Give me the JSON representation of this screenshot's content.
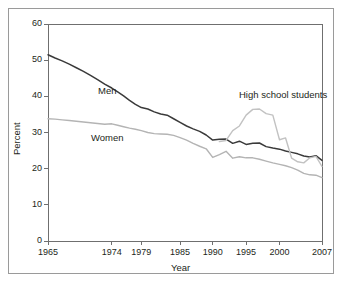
{
  "chart_data": {
    "type": "line",
    "title": "",
    "xlabel": "Year",
    "ylabel": "Percent",
    "xlim": [
      1965,
      2007
    ],
    "ylim": [
      0,
      60
    ],
    "ytick_labels": [
      "60",
      "50",
      "40",
      "30",
      "20",
      "10",
      "0"
    ],
    "yticks": [
      60,
      50,
      40,
      30,
      20,
      10,
      0
    ],
    "xtick_labels": [
      "1965",
      "1974",
      "1979",
      "1985",
      "1990",
      "1995",
      "2000",
      "2007"
    ],
    "xticks": [
      1965,
      1974,
      1979,
      1985,
      1990,
      1995,
      2000,
      2007
    ],
    "grid": false,
    "legend_position": "inline-annotations",
    "annotations": [
      {
        "text": "Men",
        "x": 1972,
        "y": 41.5
      },
      {
        "text": "Women",
        "x": 1971,
        "y": 28.5
      },
      {
        "text": "High school students",
        "x": 1994,
        "y": 40.5
      }
    ],
    "series": [
      {
        "name": "Men",
        "color": "#3a3a3a",
        "x": [
          1965,
          1966,
          1967,
          1968,
          1969,
          1970,
          1971,
          1972,
          1973,
          1974,
          1975,
          1976,
          1977,
          1978,
          1979,
          1980,
          1981,
          1982,
          1983,
          1984,
          1985,
          1986,
          1987,
          1988,
          1989,
          1990,
          1991,
          1992,
          1993,
          1994,
          1995,
          1996,
          1997,
          1998,
          1999,
          2000,
          2001,
          2002,
          2003,
          2004,
          2005,
          2006,
          2007
        ],
        "values": [
          51.5,
          50.6,
          49.8,
          48.9,
          47.9,
          46.9,
          45.8,
          44.6,
          43.4,
          42.3,
          41.2,
          40.1,
          38.9,
          37.8,
          36.9,
          36.5,
          35.7,
          35.1,
          34.8,
          33.8,
          32.8,
          31.8,
          31.0,
          30.3,
          29.3,
          27.9,
          28.1,
          28.2,
          27.0,
          27.6,
          26.7,
          27.0,
          27.1,
          26.1,
          25.7,
          25.4,
          24.9,
          24.5,
          24.1,
          23.5,
          23.2,
          23.6,
          22.3
        ]
      },
      {
        "name": "Women",
        "color": "#b4b4b4",
        "x": [
          1965,
          1966,
          1967,
          1968,
          1969,
          1970,
          1971,
          1972,
          1973,
          1974,
          1975,
          1976,
          1977,
          1978,
          1979,
          1980,
          1981,
          1982,
          1983,
          1984,
          1985,
          1986,
          1987,
          1988,
          1989,
          1990,
          1991,
          1992,
          1993,
          1994,
          1995,
          1996,
          1997,
          1998,
          1999,
          2000,
          2001,
          2002,
          2003,
          2004,
          2005,
          2006,
          2007
        ],
        "values": [
          33.8,
          33.7,
          33.5,
          33.3,
          33.1,
          32.9,
          32.7,
          32.5,
          32.3,
          32.4,
          32.0,
          31.6,
          31.2,
          30.9,
          30.5,
          30.0,
          29.7,
          29.6,
          29.5,
          29.2,
          28.6,
          27.9,
          27.0,
          26.2,
          25.5,
          23.1,
          23.9,
          24.8,
          22.9,
          23.3,
          23.0,
          23.0,
          22.6,
          22.1,
          21.6,
          21.2,
          20.8,
          20.3,
          19.6,
          18.7,
          18.3,
          18.2,
          17.5
        ]
      },
      {
        "name": "High school students",
        "color": "#c2c2c2",
        "x": [
          1991,
          1992,
          1993,
          1994,
          1995,
          1996,
          1997,
          1998,
          1999,
          2000,
          2001,
          2002,
          2003,
          2004,
          2005,
          2006,
          2007
        ],
        "values": [
          27.5,
          27.8,
          30.5,
          31.8,
          34.8,
          36.4,
          36.5,
          35.2,
          34.8,
          28.0,
          28.5,
          22.9,
          21.9,
          21.6,
          23.0,
          23.4,
          20.6
        ]
      }
    ]
  }
}
